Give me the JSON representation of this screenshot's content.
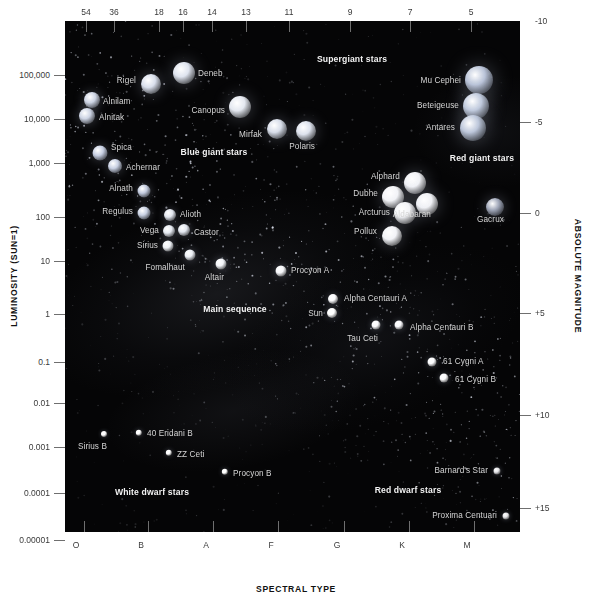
{
  "chart_data": {
    "type": "scatter",
    "xlabel": "SPECTRAL TYPE",
    "ylabel": "LUMINOSITY (SUN=1)",
    "y2label": "ABSOLUTE MAGNITUDE",
    "xlabel_top": "Surface temperature (thousands of Kelvin)",
    "grid": false,
    "legend": "none",
    "x_ticks_bottom": [
      "O",
      "B",
      "A",
      "F",
      "G",
      "K",
      "M"
    ],
    "x_ticks_top": [
      "54",
      "36",
      "18",
      "16",
      "14",
      "13",
      "11",
      "9",
      "7",
      "5"
    ],
    "y_ticks_left": [
      "100,000",
      "10,000",
      "1,000",
      "100",
      "10",
      "1",
      "0.1",
      "0.01",
      "0.001",
      "0.0001",
      "0.00001"
    ],
    "y_ticks_right": [
      "-10",
      "-5",
      "0",
      "+5",
      "+10",
      "+15"
    ],
    "ylim": [
      1e-05,
      1000000
    ],
    "regions": [
      {
        "label": "Supergiant stars",
        "x": 352,
        "y": 59
      },
      {
        "label": "Blue giant stars",
        "x": 214,
        "y": 152
      },
      {
        "label": "Red giant stars",
        "x": 482,
        "y": 158
      },
      {
        "label": "Main sequence",
        "x": 235,
        "y": 309
      },
      {
        "label": "White dwarf stars",
        "x": 152,
        "y": 492
      },
      {
        "label": "Red dwarf stars",
        "x": 408,
        "y": 490
      }
    ],
    "stars": [
      {
        "name": "Deneb",
        "x": 184,
        "y": 73,
        "r": 11,
        "color": "#dfe4ef",
        "label_side": "right",
        "lx": 198,
        "ly": 73
      },
      {
        "name": "Rigel",
        "x": 151,
        "y": 84,
        "r": 10,
        "color": "#d9dfec",
        "label_side": "left",
        "lx": 136,
        "ly": 80
      },
      {
        "name": "Alnilam",
        "x": 92,
        "y": 100,
        "r": 8,
        "color": "#cdd4e4",
        "label_side": "right",
        "lx": 103,
        "ly": 101
      },
      {
        "name": "Alnitak",
        "x": 87,
        "y": 116,
        "r": 8,
        "color": "#cdd4e4",
        "label_side": "right",
        "lx": 99,
        "ly": 117
      },
      {
        "name": "Canopus",
        "x": 240,
        "y": 107,
        "r": 11,
        "color": "#e4e8f0",
        "label_side": "left",
        "lx": 225,
        "ly": 110
      },
      {
        "name": "Mirfak",
        "x": 277,
        "y": 129,
        "r": 10,
        "color": "#d7dde9",
        "label_side": "left",
        "lx": 262,
        "ly": 134
      },
      {
        "name": "Polaris",
        "x": 306,
        "y": 131,
        "r": 10,
        "color": "#dde2ed",
        "label_side": "left",
        "lx": 315,
        "ly": 146
      },
      {
        "name": "Spica",
        "x": 100,
        "y": 153,
        "r": 7.5,
        "color": "#c6cee2",
        "label_side": "right",
        "lx": 111,
        "ly": 147
      },
      {
        "name": "Achernar",
        "x": 115,
        "y": 166,
        "r": 7,
        "color": "#c8d0e3",
        "label_side": "right",
        "lx": 126,
        "ly": 167
      },
      {
        "name": "Alnath",
        "x": 144,
        "y": 191,
        "r": 6.5,
        "color": "#c3cbdf",
        "label_side": "left",
        "lx": 133,
        "ly": 188
      },
      {
        "name": "Regulus",
        "x": 144,
        "y": 213,
        "r": 6.5,
        "color": "#c8d0e2",
        "label_side": "left",
        "lx": 133,
        "ly": 211
      },
      {
        "name": "Alioth",
        "x": 170,
        "y": 215,
        "r": 6,
        "color": "#e2e6ef",
        "label_side": "right",
        "lx": 180,
        "ly": 214
      },
      {
        "name": "Vega",
        "x": 169,
        "y": 231,
        "r": 6,
        "color": "#e6eaf2",
        "label_side": "left",
        "lx": 159,
        "ly": 230
      },
      {
        "name": "Castor",
        "x": 184,
        "y": 230,
        "r": 6,
        "color": "#e3e7f0",
        "label_side": "right",
        "lx": 194,
        "ly": 232
      },
      {
        "name": "Sirius",
        "x": 168,
        "y": 246,
        "r": 5.5,
        "color": "#eef1f6",
        "label_side": "left",
        "lx": 158,
        "ly": 245
      },
      {
        "name": "Fomalhaut",
        "x": 190,
        "y": 255,
        "r": 5.5,
        "color": "#eceff5",
        "label_side": "left",
        "lx": 185,
        "ly": 267
      },
      {
        "name": "Altair",
        "x": 221,
        "y": 264,
        "r": 5.5,
        "color": "#f2f4f8",
        "label_side": "left",
        "lx": 224,
        "ly": 277
      },
      {
        "name": "Procyon A",
        "x": 281,
        "y": 271,
        "r": 5.5,
        "color": "#f6f7fa",
        "label_side": "right",
        "lx": 291,
        "ly": 270
      },
      {
        "name": "Alpha Centauri A",
        "x": 333,
        "y": 299,
        "r": 5,
        "color": "#fbfbfd",
        "label_side": "right",
        "lx": 344,
        "ly": 298
      },
      {
        "name": "Sun",
        "x": 332,
        "y": 313,
        "r": 5,
        "color": "#ffffff",
        "label_side": "left",
        "lx": 323,
        "ly": 313
      },
      {
        "name": "Tau Ceti",
        "x": 376,
        "y": 325,
        "r": 4.5,
        "color": "#fafafc",
        "label_side": "left",
        "lx": 378,
        "ly": 338
      },
      {
        "name": "Alpha Centauri B",
        "x": 399,
        "y": 325,
        "r": 4.5,
        "color": "#f8f8fb",
        "label_side": "right",
        "lx": 410,
        "ly": 327
      },
      {
        "name": "61 Cygni A",
        "x": 432,
        "y": 362,
        "r": 4.5,
        "color": "#fcfcfe",
        "label_side": "right",
        "lx": 443,
        "ly": 361
      },
      {
        "name": "61 Cygni B",
        "x": 444,
        "y": 378,
        "r": 4.5,
        "color": "#fafafc",
        "label_side": "right",
        "lx": 455,
        "ly": 379
      },
      {
        "name": "Mu Cephei",
        "x": 479,
        "y": 80,
        "r": 14,
        "color": "#b9c3d8",
        "label_side": "left",
        "lx": 461,
        "ly": 80
      },
      {
        "name": "Beteigeuse",
        "x": 476,
        "y": 106,
        "r": 13,
        "color": "#c0cadd",
        "label_side": "left",
        "lx": 459,
        "ly": 105
      },
      {
        "name": "Antares",
        "x": 473,
        "y": 128,
        "r": 13,
        "color": "#bcc6da",
        "label_side": "left",
        "lx": 455,
        "ly": 127
      },
      {
        "name": "Alphard",
        "x": 415,
        "y": 183,
        "r": 11,
        "color": "#f1f2f6",
        "label_side": "left",
        "lx": 400,
        "ly": 176
      },
      {
        "name": "Dubhe",
        "x": 393,
        "y": 197,
        "r": 11,
        "color": "#f3f4f7",
        "label_side": "left",
        "lx": 378,
        "ly": 193
      },
      {
        "name": "Aldabaran",
        "x": 427,
        "y": 204,
        "r": 11,
        "color": "#f0f1f5",
        "label_side": "left",
        "lx": 431,
        "ly": 214
      },
      {
        "name": "Arcturus",
        "x": 405,
        "y": 213,
        "r": 11,
        "color": "#f2f3f7",
        "label_side": "left",
        "lx": 390,
        "ly": 212
      },
      {
        "name": "Gacrux",
        "x": 495,
        "y": 207,
        "r": 9,
        "color": "#9fa6b8",
        "label_side": "left",
        "lx": 504,
        "ly": 219
      },
      {
        "name": "Pollux",
        "x": 392,
        "y": 236,
        "r": 10,
        "color": "#f2f3f7",
        "label_side": "left",
        "lx": 377,
        "ly": 231
      },
      {
        "name": "Sirius B",
        "x": 104,
        "y": 434,
        "r": 3,
        "color": "#ffffff",
        "label_side": "left",
        "lx": 107,
        "ly": 446
      },
      {
        "name": "40 Eridani B",
        "x": 139,
        "y": 433,
        "r": 3.2,
        "color": "#ffffff",
        "label_side": "right",
        "lx": 147,
        "ly": 433
      },
      {
        "name": "ZZ Ceti",
        "x": 169,
        "y": 453,
        "r": 3.2,
        "color": "#ffffff",
        "label_side": "right",
        "lx": 177,
        "ly": 454
      },
      {
        "name": "Procyon B",
        "x": 225,
        "y": 472,
        "r": 3.2,
        "color": "#ffffff",
        "label_side": "right",
        "lx": 233,
        "ly": 473
      },
      {
        "name": "Barnard's Star",
        "x": 497,
        "y": 471,
        "r": 3.5,
        "color": "#e3e3e6",
        "label_side": "left",
        "lx": 488,
        "ly": 470
      },
      {
        "name": "Proxima Centuari",
        "x": 506,
        "y": 516,
        "r": 3.5,
        "color": "#e3e3e6",
        "label_side": "left",
        "lx": 497,
        "ly": 515
      }
    ]
  },
  "axes": {
    "top": {
      "ticks": [
        {
          "label": "54",
          "x": 86
        },
        {
          "label": "36",
          "x": 114
        },
        {
          "label": "18",
          "x": 159
        },
        {
          "label": "16",
          "x": 183
        },
        {
          "label": "14",
          "x": 212
        },
        {
          "label": "13",
          "x": 246
        },
        {
          "label": "11",
          "x": 289
        },
        {
          "label": "9",
          "x": 350
        },
        {
          "label": "7",
          "x": 410
        },
        {
          "label": "5",
          "x": 471
        }
      ]
    },
    "bottom": {
      "title": "SPECTRAL TYPE",
      "ticks": [
        {
          "x": 84
        },
        {
          "x": 148
        },
        {
          "x": 213
        },
        {
          "x": 278
        },
        {
          "x": 344
        },
        {
          "x": 409
        },
        {
          "x": 474
        }
      ],
      "labels": [
        {
          "label": "O",
          "x": 76
        },
        {
          "label": "B",
          "x": 141
        },
        {
          "label": "A",
          "x": 206
        },
        {
          "label": "F",
          "x": 271
        },
        {
          "label": "G",
          "x": 337
        },
        {
          "label": "K",
          "x": 402
        },
        {
          "label": "M",
          "x": 467
        }
      ]
    },
    "left": {
      "title": "LUMINOSITY (SUN=1)",
      "ticks": [
        {
          "label": "100,000",
          "y": 75
        },
        {
          "label": "10,000",
          "y": 119
        },
        {
          "label": "1,000",
          "y": 163
        },
        {
          "label": "100",
          "y": 217
        },
        {
          "label": "10",
          "y": 261
        },
        {
          "label": "1",
          "y": 314
        },
        {
          "label": "0.1",
          "y": 362
        },
        {
          "label": "0.01",
          "y": 403
        },
        {
          "label": "0.001",
          "y": 447
        },
        {
          "label": "0.0001",
          "y": 493
        },
        {
          "label": "0.00001",
          "y": 540
        }
      ]
    },
    "right": {
      "title": "ABSOLUTE MAGNITUDE",
      "ticks": [
        {
          "label": "-10",
          "y": 21
        },
        {
          "label": "-5",
          "y": 122
        },
        {
          "label": "0",
          "y": 213
        },
        {
          "label": "+5",
          "y": 313
        },
        {
          "label": "+10",
          "y": 415
        },
        {
          "label": "+15",
          "y": 508
        }
      ]
    }
  }
}
